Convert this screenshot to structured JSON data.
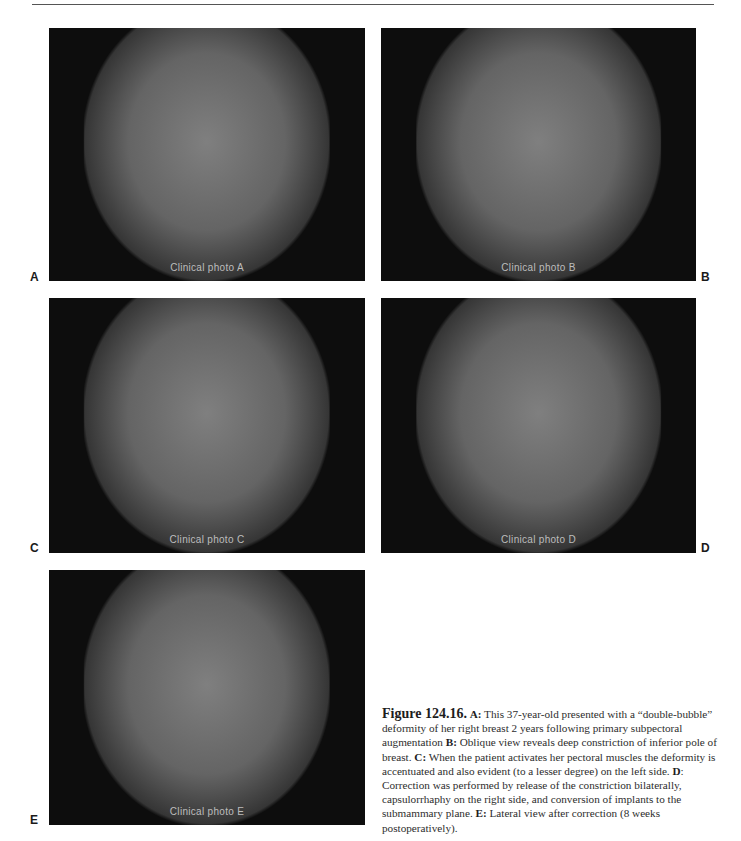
{
  "page": {
    "header_text_visible": false
  },
  "figure": {
    "number": "Figure 124.16.",
    "panels": [
      {
        "label": "A",
        "description": "Clinical photograph, frontal view (preoperative)",
        "note": "Clinical photo A"
      },
      {
        "label": "B",
        "description": "Clinical photograph, oblique view (preoperative)",
        "note": "Clinical photo B"
      },
      {
        "label": "C",
        "description": "Clinical photograph, frontal view with pectoral activation",
        "note": "Clinical photo C"
      },
      {
        "label": "D",
        "description": "Clinical photograph, frontal view after correction",
        "note": "Clinical photo D"
      },
      {
        "label": "E",
        "description": "Clinical photograph, lateral view after correction",
        "note": "Clinical photo E"
      }
    ],
    "caption": {
      "a_label": "A:",
      "a_text": " This 37-year-old presented with a “double-bubble” deformity of her right breast 2 years following primary subpectoral augmentation ",
      "b_label": "B:",
      "b_text": " Oblique view reveals deep constriction of inferior pole of breast. ",
      "c_label": "C:",
      "c_text": " When the patient activates her pectoral muscles the deformity is accentuated and also evident (to a lesser degree) on the left side. ",
      "d_label": "D",
      "d_text": ": Correction was performed by release of the constriction bilaterally, capsulorrhaphy on the right side, and conversion of implants to the submammary plane. ",
      "e_label": "E:",
      "e_text": " Lateral view after correction (8 weeks postoperatively)."
    }
  }
}
